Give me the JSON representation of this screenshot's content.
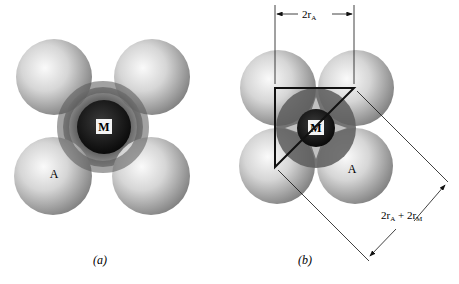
{
  "figure": {
    "panels": [
      {
        "id": "a",
        "caption": "(a)",
        "center_label": "M",
        "anion_label": "A"
      },
      {
        "id": "b",
        "caption": "(b)",
        "center_label": "M",
        "anion_label": "A",
        "top_dimension": "2r",
        "top_dimension_sub": "A",
        "diag_dimension_part1": "2r",
        "diag_dimension_sub1": "A",
        "diag_dimension_plus": " + 2r",
        "diag_dimension_sub2": "M"
      }
    ],
    "colors": {
      "anion_light": "#f4f4f4",
      "anion_dark": "#8a8a8a",
      "cation_ring": "#6e6e6e",
      "cation_core": "#151515",
      "line": "#111111"
    }
  }
}
